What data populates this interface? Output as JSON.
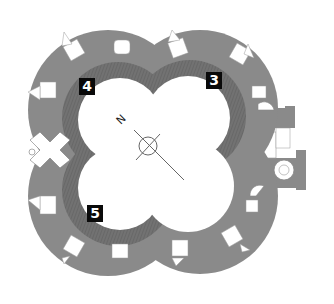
{
  "diagram": {
    "type": "castle floor plan",
    "shape": "quatrefoil",
    "colors": {
      "wall": "#8a8a8a",
      "hatched_room": "#6f6f6f",
      "courtyard": "#ffffff",
      "label_bg": "#0a0a0a",
      "label_text": "#ffffff",
      "line": "#555555"
    },
    "labels": [
      {
        "id": "4",
        "text": "4",
        "x": 78,
        "y": 77
      },
      {
        "id": "3",
        "text": "3",
        "x": 206,
        "y": 72
      },
      {
        "id": "5",
        "text": "5",
        "x": 86,
        "y": 205
      }
    ],
    "compass": {
      "north_letter": "N",
      "icon": "north-arrow-compass-icon"
    }
  }
}
